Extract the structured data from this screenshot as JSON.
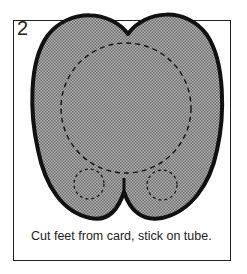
{
  "step_number": "2",
  "caption": "Cut feet from card, stick on tube.",
  "colors": {
    "outline": "#111111",
    "fill": "#9a9a9a",
    "frame": "#222222"
  },
  "illustration": {
    "shape": "feet-template",
    "elements": [
      "large-dashed-circle",
      "left-small-dashed-circle",
      "right-small-dashed-circle",
      "center-notch"
    ]
  }
}
